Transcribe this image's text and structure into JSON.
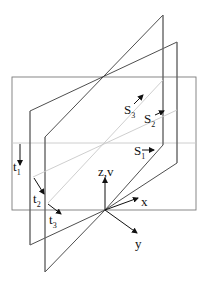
{
  "diagram": {
    "colors": {
      "dark_line": "#3a3a3a",
      "mid_line": "#7a7a7a",
      "light_line": "#c8c8c8",
      "text": "#111111"
    },
    "labels": {
      "s1": {
        "base": "S",
        "sub": "1"
      },
      "s2": {
        "base": "S",
        "sub": "2"
      },
      "s3": {
        "base": "S",
        "sub": "3"
      },
      "t1": {
        "base": "t",
        "sub": "1"
      },
      "t2": {
        "base": "t",
        "sub": "2"
      },
      "t3": {
        "base": "t",
        "sub": "3"
      },
      "z_axis": "z,v",
      "x_axis": "x",
      "y_axis": "y"
    }
  }
}
